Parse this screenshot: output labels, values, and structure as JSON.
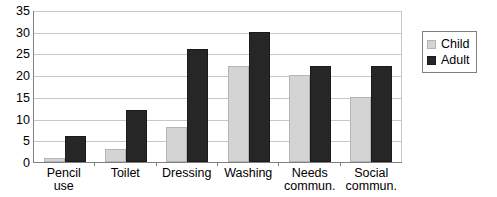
{
  "chart_data": {
    "type": "bar",
    "title": "",
    "subtitle": "",
    "xlabel": "",
    "ylabel": "",
    "ylim": [
      0,
      35
    ],
    "yticks": [
      0,
      5,
      10,
      15,
      20,
      25,
      30,
      35
    ],
    "grid": "horizontal",
    "legend_position": "right",
    "categories": [
      "Pencil\nuse",
      "Toilet",
      "Dressing",
      "Washing",
      "Needs\ncommun.",
      "Social\ncommun."
    ],
    "series": [
      {
        "name": "Child",
        "color": "#d4d4d4",
        "values": [
          1,
          3,
          8,
          22,
          20,
          15
        ]
      },
      {
        "name": "Adult",
        "color": "#262626",
        "values": [
          6,
          12,
          26,
          30,
          22,
          22
        ]
      }
    ]
  },
  "legend": {
    "items": [
      {
        "label": "Child",
        "swatch": "child-swatch"
      },
      {
        "label": "Adult",
        "swatch": "adult-swatch"
      }
    ]
  },
  "colors": {
    "child": "#d4d4d4",
    "adult": "#262626",
    "gridline": "#c8c8c8",
    "axis": "#808080",
    "background": "#ffffff",
    "text": "#000000"
  }
}
